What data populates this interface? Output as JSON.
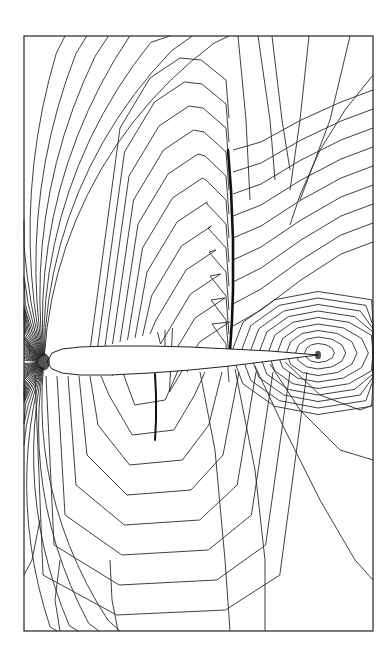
{
  "figure": {
    "type": "contour-plot",
    "background": "#ffffff",
    "line_color": "#2a2a2a",
    "frame": {
      "x": 24,
      "y": 36,
      "width": 349,
      "height": 595
    },
    "airfoil": {
      "leading_edge": [
        47,
        362
      ],
      "trailing_edge": [
        318,
        355
      ],
      "upper_surface": [
        [
          47,
          362
        ],
        [
          52,
          353
        ],
        [
          62,
          349
        ],
        [
          80,
          347
        ],
        [
          110,
          346
        ],
        [
          150,
          346
        ],
        [
          190,
          347
        ],
        [
          230,
          349
        ],
        [
          270,
          351
        ],
        [
          318,
          355
        ]
      ],
      "lower_surface": [
        [
          318,
          355
        ],
        [
          270,
          361
        ],
        [
          230,
          366
        ],
        [
          190,
          370
        ],
        [
          150,
          373
        ],
        [
          110,
          375
        ],
        [
          80,
          375
        ],
        [
          62,
          373
        ],
        [
          52,
          369
        ],
        [
          47,
          362
        ]
      ]
    },
    "upper_shock": {
      "path": [
        [
          228,
          150
        ],
        [
          231,
          190
        ],
        [
          233,
          240
        ],
        [
          233,
          290
        ],
        [
          232,
          320
        ],
        [
          230,
          350
        ]
      ],
      "stroke_width": 2.6
    },
    "lower_shock": {
      "path": [
        [
          155,
          374
        ],
        [
          156,
          395
        ],
        [
          156,
          420
        ],
        [
          155,
          440
        ]
      ],
      "stroke_width": 2.0
    },
    "singularities": [
      {
        "name": "leading-edge-stagnation",
        "center": [
          44,
          362
        ]
      },
      {
        "name": "trailing-edge-wake",
        "center": [
          318,
          355
        ]
      }
    ]
  }
}
